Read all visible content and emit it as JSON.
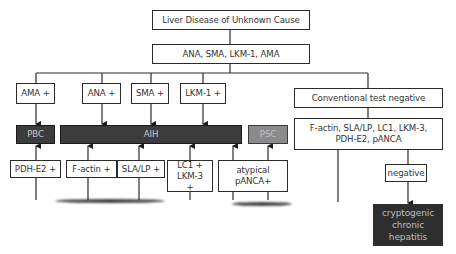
{
  "diagram": {
    "root": "Liver Disease of Unknown Cause",
    "screen": "ANA, SMA, LKM-1, AMA",
    "branches": {
      "ama": "AMA +",
      "ana": "ANA +",
      "sma": "SMA +",
      "lkm1": "LKM-1 +",
      "conventional_negative": "Conventional test negative"
    },
    "diagnoses": {
      "pbc": "PBC",
      "aih": "AIH",
      "psc": "PSC"
    },
    "secondary_tests": "F-actin, SLA/LP, LC1, LKM-3, PDH-E2, pANCA",
    "secondary_markers": {
      "pdh_e2": "PDH-E2 +",
      "f_actin": "F-actin +",
      "sla_lp": "SLA/LP +",
      "lc1_lkm3": "LC1 + LKM-3 +",
      "atypical_panca": "atypical pANCA+"
    },
    "negative": "negative",
    "cryptogenic": "cryptogenic chronic hepatitis",
    "colors": {
      "dark_fill": "#3c3c3c",
      "psc_fill": "#8a8a8a",
      "line": "#2a2a2a"
    }
  }
}
